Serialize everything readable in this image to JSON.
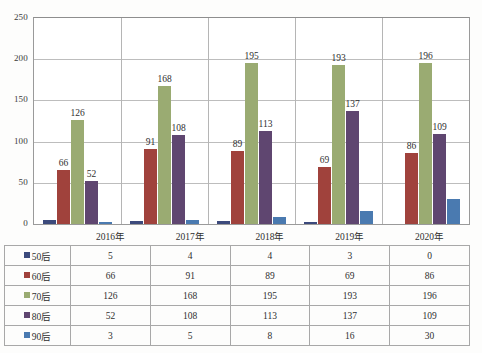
{
  "chart_data": {
    "type": "bar",
    "title": "",
    "xlabel": "",
    "ylabel": "",
    "categories": [
      "2016年",
      "2017年",
      "2018年",
      "2019年",
      "2020年"
    ],
    "ylim": [
      0,
      250
    ],
    "yticks": [
      0,
      50,
      100,
      150,
      200,
      250
    ],
    "grid": true,
    "legend_position": "table-left",
    "labeled_series": [
      "60后",
      "70后",
      "80后"
    ],
    "series": [
      {
        "name": "50后",
        "color": "#3c4a7c",
        "values": [
          5,
          4,
          4,
          3,
          0
        ]
      },
      {
        "name": "60后",
        "color": "#a0423c",
        "values": [
          66,
          91,
          89,
          69,
          86
        ]
      },
      {
        "name": "70后",
        "color": "#9aab72",
        "values": [
          126,
          168,
          195,
          193,
          196
        ]
      },
      {
        "name": "80后",
        "color": "#5f4670",
        "values": [
          52,
          108,
          113,
          137,
          109
        ]
      },
      {
        "name": "90后",
        "color": "#4a7ab0",
        "values": [
          3,
          5,
          8,
          16,
          30
        ]
      }
    ]
  },
  "table": {
    "header_blank": "",
    "columns": [
      "2016年",
      "2017年",
      "2018年",
      "2019年",
      "2020年"
    ]
  },
  "caption": ""
}
